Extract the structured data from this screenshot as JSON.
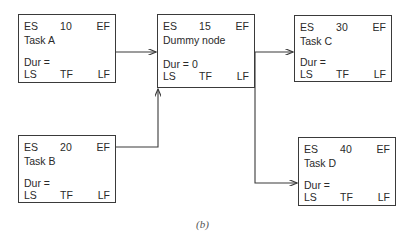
{
  "figure": {
    "caption": "(b)",
    "labels": {
      "es": "ES",
      "ef": "EF",
      "ls": "LS",
      "tf": "TF",
      "lf": "LF"
    },
    "nodes": [
      {
        "id": "task-a",
        "name": "Task A",
        "value": "10",
        "dur": "Dur ="
      },
      {
        "id": "dummy",
        "name": "Dummy node",
        "value": "15",
        "dur": "Dur = 0"
      },
      {
        "id": "task-c",
        "name": "Task C",
        "value": "30",
        "dur": "Dur ="
      },
      {
        "id": "task-b",
        "name": "Task B",
        "value": "20",
        "dur": "Dur ="
      },
      {
        "id": "task-d",
        "name": "Task D",
        "value": "40",
        "dur": "Dur ="
      }
    ],
    "edges": [
      {
        "from": "task-a",
        "to": "dummy"
      },
      {
        "from": "task-b",
        "to": "dummy"
      },
      {
        "from": "dummy",
        "to": "task-c"
      },
      {
        "from": "dummy",
        "to": "task-d"
      }
    ]
  }
}
